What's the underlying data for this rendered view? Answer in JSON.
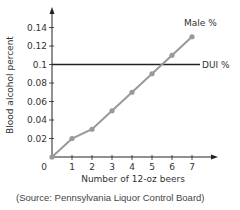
{
  "chart_data": {
    "type": "line",
    "title": "",
    "xlabel": "Number of 12-oz beers",
    "ylabel": "Blood alcohol percent",
    "x": [
      0,
      1,
      2,
      3,
      4,
      5,
      6,
      7
    ],
    "x_ticks": [
      "0",
      "1",
      "2",
      "3",
      "4",
      "5",
      "6",
      "7"
    ],
    "y_ticks": [
      "0.02",
      "0.04",
      "0.06",
      "0.08",
      "0.1",
      "0.12",
      "0.14"
    ],
    "xlim": [
      0,
      7.8
    ],
    "ylim": [
      0,
      0.155
    ],
    "grid": false,
    "series": [
      {
        "name": "Male %",
        "values": [
          0,
          0.02,
          0.03,
          0.05,
          0.07,
          0.09,
          0.11,
          0.13
        ],
        "color": "#999999",
        "markers": true
      },
      {
        "name": "DUI %",
        "values": [
          0.1,
          0.1,
          0.1,
          0.1,
          0.1,
          0.1,
          0.1,
          0.1
        ],
        "color": "#222222",
        "markers": false,
        "kind": "horizontal-reference"
      }
    ],
    "legend": "inline labels at line ends",
    "annotation": "(Source: Pennsylvania Liquor Control Board)"
  },
  "labels": {
    "origin": "0",
    "male": "Male %",
    "dui": "DUI %",
    "xlabel": "Number of 12-oz beers",
    "ylabel": "Blood alcohol percent",
    "source": "(Source: Pennsylvania Liquor Control Board)"
  }
}
